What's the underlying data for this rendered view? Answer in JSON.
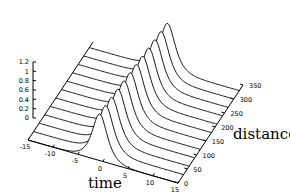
{
  "chart_data": {
    "type": "line",
    "subtype": "3d-waterfall",
    "title": "",
    "xlabel": "time",
    "ylabel": "distance",
    "zlabel": "",
    "xlim": [
      -15,
      15
    ],
    "ylim": [
      0,
      350
    ],
    "zlim": [
      0,
      1.2
    ],
    "x_ticks": [
      "-15",
      "-10",
      "-5",
      "0",
      "5",
      "10",
      "15"
    ],
    "y_ticks": [
      "0",
      "50",
      "100",
      "150",
      "200",
      "250",
      "300",
      "350"
    ],
    "z_ticks": [
      "0",
      "0.2",
      "0.4",
      "0.6",
      "0.8",
      "1",
      "1.2"
    ],
    "grid": false,
    "legend": null,
    "series_description": "Pulse amplitude vs time at successive distances; each trace is a single localized pulse of peak ~1 centered near time 0",
    "distances": [
      0,
      30,
      60,
      90,
      120,
      150,
      180,
      210,
      240,
      270,
      300,
      330
    ],
    "pulse": {
      "center_time": 0,
      "peak_amplitude": 1.0,
      "width": 1.6
    }
  },
  "labels": {
    "time": "time",
    "distance": "distance"
  }
}
